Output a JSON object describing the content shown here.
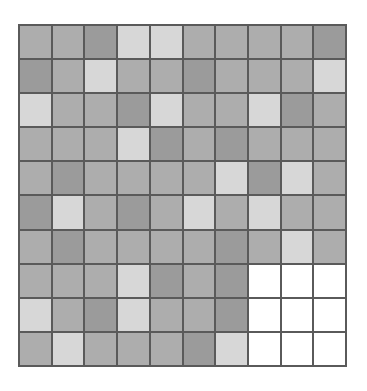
{
  "board": {
    "rows": 10,
    "cols": 10,
    "palette": {
      "dark": "#9b9b9b",
      "medium": "#adadad",
      "light": "#d7d7d7",
      "empty": "#ffffff"
    },
    "cells": [
      [
        "medium",
        "medium",
        "dark",
        "light",
        "light",
        "medium",
        "medium",
        "medium",
        "medium",
        "dark"
      ],
      [
        "dark",
        "medium",
        "light",
        "medium",
        "medium",
        "dark",
        "medium",
        "medium",
        "medium",
        "light"
      ],
      [
        "light",
        "medium",
        "medium",
        "dark",
        "light",
        "medium",
        "medium",
        "light",
        "dark",
        "medium"
      ],
      [
        "medium",
        "medium",
        "medium",
        "light",
        "dark",
        "medium",
        "dark",
        "medium",
        "medium",
        "medium"
      ],
      [
        "medium",
        "dark",
        "medium",
        "medium",
        "medium",
        "medium",
        "light",
        "dark",
        "light",
        "medium"
      ],
      [
        "dark",
        "light",
        "medium",
        "dark",
        "medium",
        "light",
        "medium",
        "light",
        "medium",
        "medium"
      ],
      [
        "medium",
        "dark",
        "medium",
        "medium",
        "medium",
        "medium",
        "dark",
        "medium",
        "light",
        "medium"
      ],
      [
        "medium",
        "medium",
        "medium",
        "light",
        "dark",
        "medium",
        "dark",
        "empty",
        "empty",
        "empty"
      ],
      [
        "light",
        "medium",
        "dark",
        "light",
        "medium",
        "medium",
        "dark",
        "empty",
        "empty",
        "empty"
      ],
      [
        "medium",
        "light",
        "medium",
        "medium",
        "medium",
        "dark",
        "light",
        "empty",
        "empty",
        "empty"
      ]
    ]
  }
}
